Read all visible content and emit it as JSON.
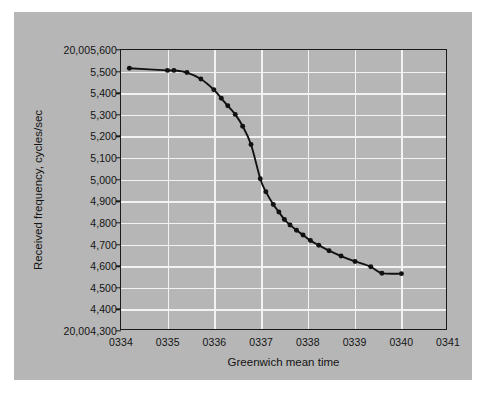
{
  "chart_data": {
    "type": "line",
    "title": "",
    "xlabel": "Greenwich mean time",
    "ylabel": "Received frequency, cycles/sec",
    "y_axis_top_label": "20,005,600",
    "y_axis_bottom_label": "20,004,300",
    "ytick_labels": [
      "20,005,600",
      "5,500",
      "5,400",
      "5,300",
      "5,200",
      "5,100",
      "5,000",
      "4,900",
      "4,800",
      "4,700",
      "4,600",
      "4,500",
      "4,400",
      "20,004,300"
    ],
    "ytick_values": [
      20005600,
      20005500,
      20005400,
      20005300,
      20005200,
      20005100,
      20005000,
      20004900,
      20004800,
      20004700,
      20004600,
      20004500,
      20004400,
      20004300
    ],
    "xtick_labels": [
      "0334",
      "0335",
      "0336",
      "0337",
      "0338",
      "0339",
      "0340",
      "0341"
    ],
    "xtick_values": [
      334,
      335,
      336,
      337,
      338,
      339,
      340,
      341
    ],
    "xlim": [
      334,
      341
    ],
    "ylim": [
      20004300,
      20005600
    ],
    "grid": true,
    "legend": null,
    "series": [
      {
        "name": "Received frequency",
        "x": [
          334.18,
          335.0,
          335.14,
          335.42,
          335.72,
          336.0,
          336.16,
          336.3,
          336.46,
          336.62,
          336.8,
          337.0,
          337.12,
          337.28,
          337.4,
          337.52,
          337.64,
          337.78,
          337.92,
          338.08,
          338.26,
          338.48,
          338.74,
          339.04,
          339.38,
          339.62,
          340.04
        ],
        "y": [
          20005515,
          20005505,
          20005505,
          20005495,
          20005465,
          20005415,
          20005375,
          20005340,
          20005300,
          20005245,
          20005160,
          20005000,
          20004940,
          20004880,
          20004845,
          20004810,
          20004785,
          20004760,
          20004738,
          20004712,
          20004690,
          20004665,
          20004640,
          20004615,
          20004590,
          20004560,
          20004558
        ]
      }
    ],
    "colors": {
      "figure_background": "#b6b6b6",
      "page_background": "#ffffff",
      "gridline": "#f2f2f2",
      "axis": "#1a1a1a",
      "curve": "#111111",
      "marker": "#111111",
      "text": "#141414"
    }
  }
}
